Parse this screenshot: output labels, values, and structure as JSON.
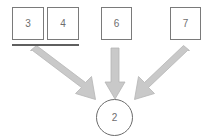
{
  "diagram": {
    "title": "",
    "background_color": "#ffffff",
    "box_border_color": "#7a7a7a",
    "circle_border_color": "#6b6b6b",
    "arrow_color": "#c9c9c9",
    "arrow_outline_color": "#b0b0b0",
    "underline_color": "#5f5f5f",
    "label_color": "#6e6e6e",
    "source_nodes": [
      {
        "label": "3",
        "shape": "square",
        "x": 12,
        "y": 7,
        "w": 32,
        "h": 33
      },
      {
        "label": "4",
        "shape": "square",
        "x": 47,
        "y": 7,
        "w": 32,
        "h": 33
      },
      {
        "label": "6",
        "shape": "square",
        "x": 101,
        "y": 7,
        "w": 31,
        "h": 33
      },
      {
        "label": "7",
        "shape": "square",
        "x": 170,
        "y": 7,
        "w": 31,
        "h": 33
      }
    ],
    "target_node": {
      "label": "2",
      "shape": "circle",
      "x": 96,
      "y": 99,
      "d": 37
    },
    "underline": {
      "x": 12,
      "y": 44,
      "w": 67,
      "h": 2
    },
    "arrows": [
      {
        "name": "arrow-left",
        "from_label": "3,4",
        "to_label": "2",
        "x1": 32,
        "y1": 53,
        "x2": 93,
        "y2": 98
      },
      {
        "name": "arrow-middle",
        "from_label": "6",
        "to_label": "2",
        "x1": 115,
        "y1": 50,
        "x2": 115,
        "y2": 98
      },
      {
        "name": "arrow-right",
        "from_label": "7",
        "to_label": "2",
        "x1": 188,
        "y1": 53,
        "x2": 137,
        "y2": 98
      }
    ]
  }
}
